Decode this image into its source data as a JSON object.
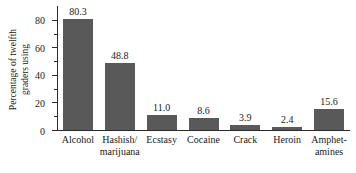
{
  "chart_data": {
    "type": "bar",
    "title": "",
    "xlabel": "",
    "ylabel": "Percentage of twelfth graders using",
    "ylabel_lines": [
      "Percentage of twelfth",
      "graders using"
    ],
    "categories": [
      "Alcohol",
      "Hashish/ marijuana",
      "Ecstasy",
      "Cocaine",
      "Crack",
      "Heroin",
      "Amphet- amines"
    ],
    "category_lines": [
      [
        "Alcohol"
      ],
      [
        "Hashish/",
        "marijuana"
      ],
      [
        "Ecstasy"
      ],
      [
        "Cocaine"
      ],
      [
        "Crack"
      ],
      [
        "Heroin"
      ],
      [
        "Amphet-",
        "amines"
      ]
    ],
    "values": [
      80.3,
      48.8,
      11.0,
      8.6,
      3.9,
      2.4,
      15.6
    ],
    "value_labels": [
      "80.3",
      "48.8",
      "11.0",
      "8.6",
      "3.9",
      "2.4",
      "15.6"
    ],
    "ylim": [
      0,
      90
    ],
    "y_major_ticks": [
      0,
      20,
      40,
      60,
      80
    ],
    "y_major_tick_labels": [
      "0",
      "20",
      "40",
      "60",
      "80"
    ],
    "y_minor_ticks": [
      10,
      30,
      50,
      70
    ],
    "grid": false,
    "legend": null,
    "bar_color": "#595959",
    "axis_color": "#2b2b2b",
    "background_color": "#ffffff"
  }
}
